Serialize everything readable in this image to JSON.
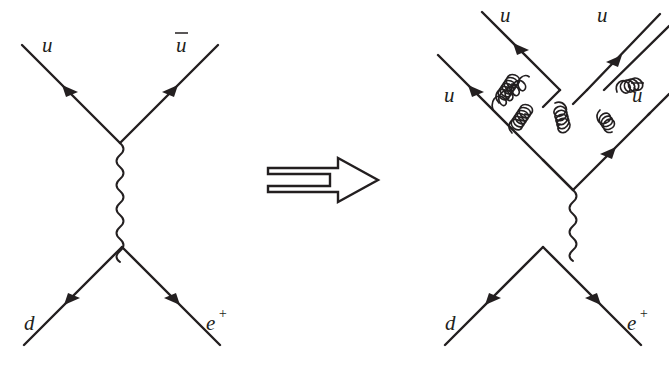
{
  "figure": {
    "kind": "feynman-diagram-pair",
    "background_color": "#ffffff",
    "ink_color": "#231f20",
    "relation_symbol": "implies-double-arrow"
  },
  "left_diagram": {
    "name": "tree-level-diagram",
    "labels": {
      "in_quark": "u",
      "out_antiquark": "u",
      "out_antiquark_bar": true,
      "in_down_quark": "d",
      "out_positron": "e",
      "out_positron_superscript": "+"
    },
    "propagator": "photon-wavy-line",
    "vertices": 2
  },
  "right_diagram": {
    "name": "gluon-corrected-diagram",
    "labels": {
      "top_left_quark": "u",
      "top_right_quark": "u",
      "left_quark": "u",
      "right_antiquark": "u",
      "right_antiquark_bar": true,
      "in_down_quark": "d",
      "out_positron": "e",
      "out_positron_superscript": "+"
    },
    "propagator": "photon-wavy-line",
    "gluons": 3,
    "vertices": 6
  },
  "relation": {
    "symbol_name": "implies-arrow",
    "symbol_text": "=>"
  }
}
